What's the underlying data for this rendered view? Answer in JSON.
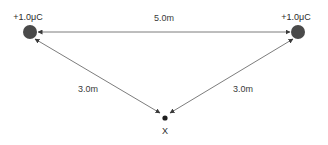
{
  "diagram": {
    "background_color": "#ffffff",
    "line_color": "#5a5a5a",
    "charge_color": "#4a4a4a",
    "text_color": "#2b2b2b",
    "charges": [
      {
        "id": "charge-left",
        "label": "+1.0μC",
        "x": 30,
        "y": 32,
        "radius": 7
      },
      {
        "id": "charge-right",
        "label": "+1.0μC",
        "x": 298,
        "y": 32,
        "radius": 7
      }
    ],
    "field_point": {
      "id": "point-x",
      "label": "X",
      "x": 165,
      "y": 118,
      "radius": 2.6
    },
    "dimensions": [
      {
        "id": "dim-top",
        "label": "5.0m",
        "label_x": 164,
        "label_y": 21,
        "from": "charge-left",
        "to": "charge-right",
        "arrows": "both"
      },
      {
        "id": "dim-left",
        "label": "3.0m",
        "label_x": 88,
        "label_y": 92,
        "from": "point-x",
        "to": "charge-left",
        "arrows": "both"
      },
      {
        "id": "dim-right",
        "label": "3.0m",
        "label_x": 243,
        "label_y": 92,
        "from": "point-x",
        "to": "charge-right",
        "arrows": "both"
      }
    ],
    "charge_label_positions": [
      {
        "x": 28,
        "y": 20
      },
      {
        "x": 296,
        "y": 20
      }
    ]
  }
}
